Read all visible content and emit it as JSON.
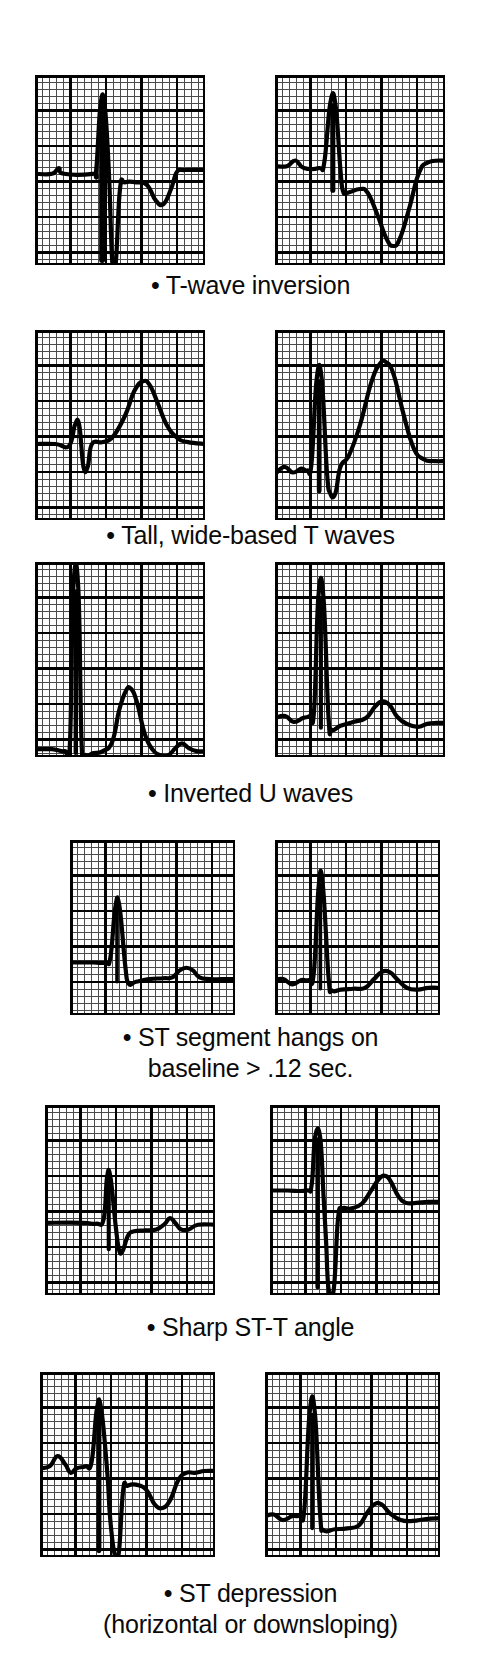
{
  "figure": {
    "background_color": "#ffffff",
    "ink_color": "#000000",
    "grid_minor_color": "#3a3a3a",
    "grid_major_color": "#000000",
    "panel_count": 12,
    "row_count": 6,
    "columns_per_row": 2
  },
  "rows": [
    {
      "id": "t-wave-inversion",
      "caption": "• T-wave inversion",
      "left_panel": {
        "name": "t-wave-inversion-example-1",
        "description": "Narrow QRS with deep S wave and shallow inverted T wave returning to baseline"
      },
      "right_panel": {
        "name": "t-wave-inversion-example-2",
        "description": "Tall R wave followed by deeply inverted symmetric T wave"
      }
    },
    {
      "id": "tall-wide-based-t-waves",
      "caption": "• Tall, wide-based T waves",
      "left_panel": {
        "name": "tall-t-wave-example-1",
        "description": "Small QRS complex followed by a tall broad upright T wave"
      },
      "right_panel": {
        "name": "tall-t-wave-example-2",
        "description": "Tall R wave with very tall wide-based peaked T wave"
      }
    },
    {
      "id": "inverted-u-waves",
      "caption": "• Inverted U waves",
      "left_panel": {
        "name": "inverted-u-wave-example-1",
        "description": "Tall narrow R wave followed by a secondary upright deflection and inverted U wave"
      },
      "right_panel": {
        "name": "inverted-u-wave-example-2",
        "description": "Tall spiked R wave with low rounded T and shallow inverted U wave"
      }
    },
    {
      "id": "st-segment-hangs-on-baseline",
      "caption": "• ST segment hangs on\nbaseline > .12 sec.",
      "left_panel": {
        "name": "st-hangs-baseline-example-1",
        "description": "Small R wave, flat prolonged ST segment lying on baseline, then low rounded T"
      },
      "right_panel": {
        "name": "st-hangs-baseline-example-2",
        "description": "Tall R wave with long flat ST segment on baseline before broad T wave"
      }
    },
    {
      "id": "sharp-st-t-angle",
      "caption": "• Sharp ST-T angle",
      "left_panel": {
        "name": "sharp-st-t-angle-example-1",
        "description": "QRS with sharp takeoff angle between flat ST segment and small T wave"
      },
      "right_panel": {
        "name": "sharp-st-t-angle-example-2",
        "description": "Deep S wave with abrupt sharp angle where the ST segment meets the T wave"
      }
    },
    {
      "id": "st-depression",
      "caption": "• ST depression\n(horizontal or downsloping)",
      "left_panel": {
        "name": "st-depression-example-1",
        "description": "QRS with depressed horizontal ST segment and inverted T wave"
      },
      "right_panel": {
        "name": "st-depression-example-2",
        "description": "Tall R wave with downsloping depressed ST segment into low T wave"
      }
    }
  ]
}
